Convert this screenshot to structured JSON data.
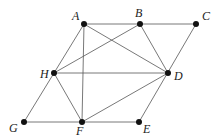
{
  "diagram": {
    "type": "geometry-figure",
    "points": [
      {
        "id": "A",
        "label": "A",
        "x": 84,
        "y": 24,
        "lx": 72,
        "ly": 20
      },
      {
        "id": "B",
        "label": "B",
        "x": 140,
        "y": 24,
        "lx": 135,
        "ly": 17
      },
      {
        "id": "C",
        "label": "C",
        "x": 196,
        "y": 24,
        "lx": 202,
        "ly": 20
      },
      {
        "id": "H",
        "label": "H",
        "x": 54,
        "y": 73,
        "lx": 40,
        "ly": 78
      },
      {
        "id": "D",
        "label": "D",
        "x": 168,
        "y": 73,
        "lx": 174,
        "ly": 80
      },
      {
        "id": "G",
        "label": "G",
        "x": 24,
        "y": 122,
        "lx": 9,
        "ly": 132
      },
      {
        "id": "F",
        "label": "F",
        "x": 82,
        "y": 122,
        "lx": 76,
        "ly": 135
      },
      {
        "id": "E",
        "label": "E",
        "x": 139,
        "y": 122,
        "lx": 143,
        "ly": 133
      }
    ],
    "edges": [
      [
        "A",
        "C"
      ],
      [
        "H",
        "D"
      ],
      [
        "G",
        "E"
      ],
      [
        "A",
        "G"
      ],
      [
        "C",
        "E"
      ],
      [
        "A",
        "F"
      ],
      [
        "A",
        "D"
      ],
      [
        "B",
        "H"
      ],
      [
        "B",
        "D"
      ],
      [
        "H",
        "F"
      ],
      [
        "F",
        "D"
      ]
    ]
  }
}
